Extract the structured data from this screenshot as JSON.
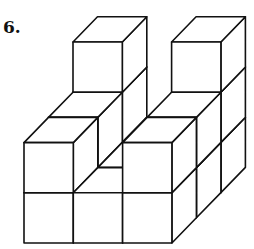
{
  "problem": {
    "number_label": "6."
  },
  "figure": {
    "stroke_color": "#111111",
    "fill_color": "#ffffff",
    "origin": [
      24,
      243
    ],
    "unit_x": 49.3,
    "unit_y": 50.2,
    "depth_dx": 24.5,
    "depth_dy": -25.2,
    "columns_note": "heights[k][i]: k = depth row (0 = front), i = column (0 = left)",
    "heights": [
      [
        2,
        1,
        2
      ],
      [
        2,
        1,
        2
      ],
      [
        3,
        1,
        3
      ]
    ]
  }
}
